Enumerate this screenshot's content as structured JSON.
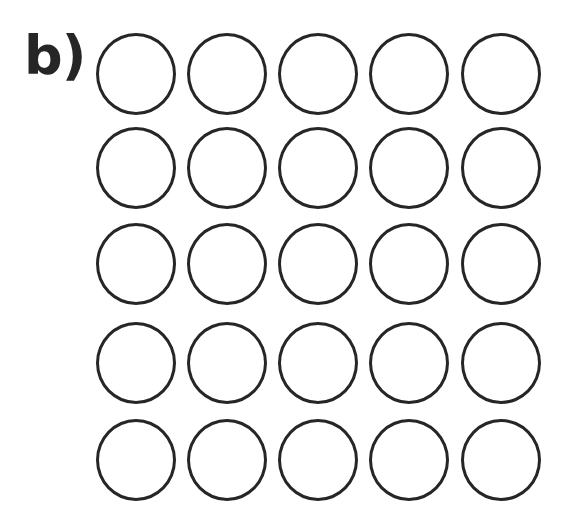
{
  "label": "b)",
  "grid": {
    "rows": 5,
    "cols": 5,
    "stroke_color": "#262626",
    "fill": "none",
    "col_centers": [
      136,
      227,
      318,
      409,
      501
    ],
    "row_centers": [
      74,
      168,
      264,
      363,
      460
    ],
    "radius": 40
  }
}
